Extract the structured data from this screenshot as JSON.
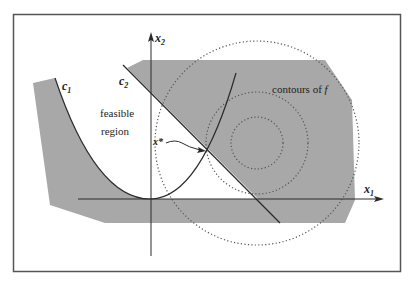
{
  "figure": {
    "labels": {
      "x2_axis": "x",
      "x2_sub": "2",
      "x1_axis": "x",
      "x1_sub": "1",
      "c1": "c",
      "c1_sub": "1",
      "c2": "c",
      "c2_sub": "2",
      "feasible_line1": "feasible",
      "feasible_line2": "region",
      "x_star": "x*",
      "contours": "contours of ",
      "contours_f": "f"
    },
    "colors": {
      "frame": "#555555",
      "shade": "#a8a8a8",
      "curve": "#2a2a2a",
      "contour": "#555555"
    }
  }
}
